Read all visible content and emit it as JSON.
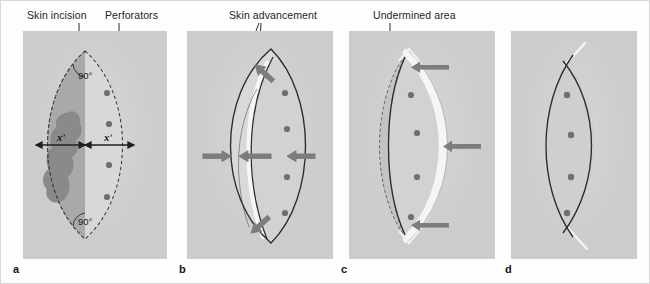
{
  "figure": {
    "background_color": "#fdfdfd",
    "border_color": "#d7d7d7",
    "panel_background": "#cccccc"
  },
  "callouts": [
    {
      "id": "skin-incision",
      "label": "Skin incision",
      "x": 26,
      "y": 8
    },
    {
      "id": "perforators",
      "label": "Perforators",
      "x": 104,
      "y": 8
    },
    {
      "id": "skin-advancement",
      "label": "Skin advancement",
      "x": 228,
      "y": 8
    },
    {
      "id": "undermined-area",
      "label": "Undermined area",
      "x": 372,
      "y": 8
    }
  ],
  "panels": [
    {
      "id": "a",
      "letter": "a",
      "annotations": {
        "angle_top": "90°",
        "angle_bottom": "90°",
        "width_left": "xʹ",
        "width_right": "xʹ"
      },
      "perforator_count": 4,
      "outline_style": "dashed",
      "has_lesion": true,
      "description": "Planned skin incision as a dashed lens, darker excision half containing the lesion, four perforators in the flap half, 90 degree apex angles, equal widths x' on each side."
    },
    {
      "id": "b",
      "letter": "b",
      "perforator_count": 4,
      "outline_style": "solid",
      "arrow_count": 4,
      "arrow_directions": [
        "right",
        "left",
        "left",
        "diagonal-up-left",
        "diagonal-down-left"
      ],
      "description": "Skin advancement: the flap curve slides across the defect, arrows show advancement direction."
    },
    {
      "id": "c",
      "letter": "c",
      "perforator_count": 4,
      "outline_style": "solid-with-dashed-undermining",
      "arrow_count": 3,
      "arrow_directions": [
        "left",
        "left",
        "left"
      ],
      "description": "Undermined area shown dashed beyond the incision; the flap band is mobilised fully, arrows indicate advancement."
    },
    {
      "id": "d",
      "letter": "d",
      "perforator_count": 4,
      "outline_style": "solid",
      "description": "Final closure: the lens closes as two crossing curves with small tails at each apex."
    }
  ],
  "colors": {
    "panel_grey": "#cccccc",
    "flap_light": "#d7d7d7",
    "excision_mid": "#a9a9a9",
    "lesion_dark": "#888888",
    "ink": "#2b2b2b",
    "arrow_grey": "#7d7d7d",
    "white_band": "#f4f4f4",
    "text": "#231f20"
  }
}
